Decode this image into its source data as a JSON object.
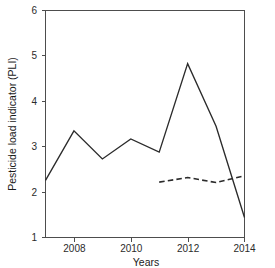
{
  "chart_data": {
    "type": "line",
    "title": "",
    "xlabel": "Years",
    "ylabel": "Pesticide load indicator (PLI)",
    "xlim": [
      2007,
      2014
    ],
    "ylim": [
      1,
      6
    ],
    "xticks": [
      "2008",
      "2010",
      "2012",
      "2014"
    ],
    "xtick_values": [
      2008,
      2010,
      2012,
      2014
    ],
    "yticks": [
      "1",
      "2",
      "3",
      "4",
      "5",
      "6"
    ],
    "ytick_values": [
      1,
      2,
      3,
      4,
      5,
      6
    ],
    "grid": false,
    "legend": "none",
    "series": [
      {
        "name": "solid-series",
        "style": "solid",
        "color": "#2b2b2b",
        "x": [
          2007,
          2008,
          2009,
          2010,
          2011,
          2012,
          2013,
          2014
        ],
        "values": [
          2.26,
          3.35,
          2.73,
          3.17,
          2.88,
          4.83,
          3.45,
          1.44
        ]
      },
      {
        "name": "dashed-series",
        "style": "dashed",
        "color": "#2b2b2b",
        "x": [
          2011,
          2012,
          2013,
          2014
        ],
        "values": [
          2.22,
          2.32,
          2.21,
          2.36
        ]
      }
    ]
  },
  "axes": {
    "y_title": "Pesticide load indicator (PLI)",
    "x_title": "Years"
  }
}
